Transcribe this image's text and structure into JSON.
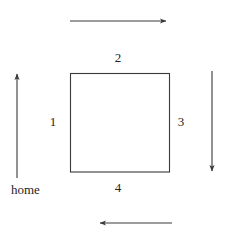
{
  "figure": {
    "background_color": "#ffffff",
    "stroke_color": "#3a3a3a",
    "text_color": "#262626",
    "width": 229,
    "height": 239
  },
  "square": {
    "name": "path-square",
    "left": 70,
    "top": 73,
    "right": 170,
    "bottom": 172,
    "side_length_px": 100
  },
  "labels": {
    "side_1": "1",
    "side_2": "2",
    "side_3": "3",
    "side_4": "4",
    "home": "home"
  },
  "sides": [
    {
      "id": "side-1",
      "label": "1",
      "position": "left",
      "direction": "up"
    },
    {
      "id": "side-2",
      "label": "2",
      "position": "top",
      "direction": "right"
    },
    {
      "id": "side-3",
      "label": "3",
      "position": "right",
      "direction": "down"
    },
    {
      "id": "side-4",
      "label": "4",
      "position": "bottom",
      "direction": "left"
    }
  ],
  "arrows": [
    {
      "id": "arrow-top",
      "direction": "right",
      "describes_side": "2",
      "x1": 70,
      "y1": 21,
      "x2": 168,
      "y2": 21
    },
    {
      "id": "arrow-left",
      "direction": "up",
      "describes_side": "1",
      "x1": 17,
      "y1": 178,
      "x2": 17,
      "y2": 71
    },
    {
      "id": "arrow-right",
      "direction": "down",
      "describes_side": "3",
      "x1": 212,
      "y1": 71,
      "x2": 212,
      "y2": 174
    },
    {
      "id": "arrow-bottom",
      "direction": "left",
      "describes_side": "4",
      "x1": 172,
      "y1": 223,
      "x2": 97,
      "y2": 223
    }
  ]
}
